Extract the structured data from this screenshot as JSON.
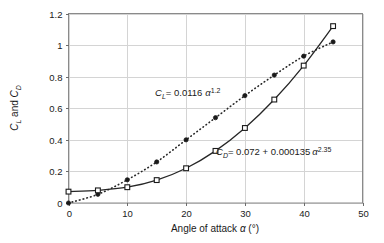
{
  "chart_data": {
    "type": "line",
    "title": "",
    "xlabel": "Angle of attack α (°)",
    "ylabel": "C_L and C_D",
    "xlim": [
      0,
      50
    ],
    "ylim": [
      0,
      1.2
    ],
    "xticks": [
      "0",
      "10",
      "20",
      "30",
      "40",
      "50"
    ],
    "xtick_values": [
      0,
      10,
      20,
      30,
      40,
      50
    ],
    "yticks": [
      "0",
      "0.2",
      "0.4",
      "0.6",
      "0.8",
      "1",
      "1.2"
    ],
    "ytick_values": [
      0,
      0.2,
      0.4,
      0.6,
      0.8,
      1.0,
      1.2
    ],
    "grid": "both",
    "legend": "none",
    "x": [
      0,
      5,
      10,
      15,
      20,
      25,
      30,
      35,
      40,
      45
    ],
    "series": [
      {
        "name": "C_L",
        "marker": "filled-circle",
        "line_style": "dotted",
        "values": [
          0,
          0.055,
          0.147,
          0.26,
          0.4,
          0.54,
          0.68,
          0.81,
          0.93,
          1.02
        ]
      },
      {
        "name": "C_D",
        "marker": "open-square",
        "line_style": "solid",
        "values": [
          0.072,
          0.08,
          0.1,
          0.145,
          0.22,
          0.33,
          0.475,
          0.655,
          0.87,
          1.12
        ]
      }
    ],
    "annotations": [
      {
        "id": "lift-equation",
        "lhs_symbol": "C",
        "lhs_subscript": "L",
        "equals": "= 0.0116",
        "alpha": "α",
        "exponent": "1.2",
        "text": "C_L = 0.0116 α^1.2",
        "x_px": 155,
        "y_px": 96
      },
      {
        "id": "drag-equation",
        "lhs_symbol": "C",
        "lhs_subscript": "D",
        "equals": "= 0.072 + 0.000135",
        "alpha": "α",
        "exponent": "2.35",
        "text": "C_D = 0.072 + 0.000135 α^2.35",
        "x_px": 216,
        "y_px": 155
      }
    ]
  },
  "axis": {
    "y_title_symbol_1": "C",
    "y_title_sub_1": "L",
    "y_title_conj": " and ",
    "y_title_symbol_2": "C",
    "y_title_sub_2": "D",
    "x_title_prefix": "Angle of attack ",
    "x_title_alpha": "α",
    "x_title_suffix": " (°)"
  },
  "colors": {
    "background": "#ffffff",
    "ink": "#1a1a1a",
    "frame": "#8a8a8a",
    "gridline": "#d4d4d4",
    "curve": "#262626"
  }
}
